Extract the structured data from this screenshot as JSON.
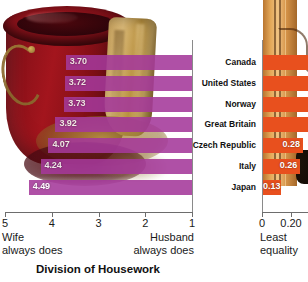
{
  "chart_data": {
    "type": "bar",
    "title": "Division of Housework",
    "orientation": "horizontal",
    "categories": [
      "Canada",
      "United States",
      "Norway",
      "Great Britain",
      "Czech Republic",
      "Italy",
      "Japan"
    ],
    "panels": [
      {
        "name": "division-of-housework",
        "values": [
          3.7,
          3.72,
          3.73,
          3.92,
          4.07,
          4.24,
          4.49
        ],
        "value_labels": [
          "3.70",
          "3.72",
          "3.73",
          "3.92",
          "4.07",
          "4.24",
          "4.49"
        ],
        "xlim": [
          5,
          1
        ],
        "reversed": true,
        "ticks": [
          "5",
          "4",
          "3",
          "2",
          "1"
        ],
        "tick_values": [
          5,
          4,
          3,
          2,
          1
        ],
        "left_caption_line1": "Wife",
        "left_caption_line2": "always does",
        "right_caption_line1": "Husband",
        "right_caption_line2": "always does",
        "color": "#a5399a"
      },
      {
        "name": "least-equality",
        "values": [
          null,
          null,
          null,
          null,
          0.28,
          0.26,
          0.13
        ],
        "value_labels": [
          "",
          "",
          "",
          "",
          "0.28",
          "0.26",
          "0.13"
        ],
        "xlim": [
          0,
          0.32
        ],
        "ticks": [
          "0",
          "0.20"
        ],
        "tick_values": [
          0,
          0.2
        ],
        "caption_line1": "Least",
        "caption_line2": "equality",
        "color": "#e8501e"
      }
    ],
    "grid": false,
    "legend": "none",
    "background_photo": "bucket-with-cloth"
  }
}
